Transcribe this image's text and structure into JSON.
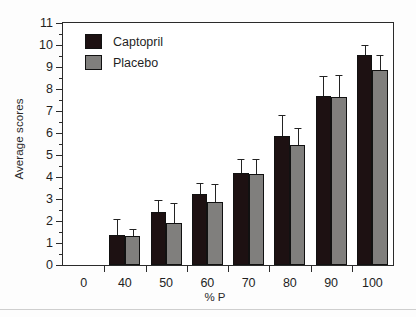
{
  "chart_data": {
    "type": "bar",
    "title": "",
    "xlabel": "% P",
    "ylabel": "Average scores",
    "categories": [
      "0",
      "40",
      "50",
      "60",
      "70",
      "80",
      "90",
      "100"
    ],
    "ylim": [
      0,
      11
    ],
    "ytick_labels": [
      "0",
      "1",
      "2",
      "3",
      "4",
      "5",
      "6",
      "7",
      "8",
      "9",
      "10",
      "11"
    ],
    "ytick_values": [
      0,
      1,
      2,
      3,
      4,
      5,
      6,
      7,
      8,
      9,
      10,
      11
    ],
    "grid": false,
    "legend_position": "top-left",
    "error_bar_style": "upper-only",
    "series": [
      {
        "name": "Captopril",
        "color": "#1d1112",
        "values": [
          null,
          1.35,
          2.4,
          3.25,
          4.2,
          5.85,
          7.7,
          9.55
        ],
        "errors": [
          null,
          0.75,
          0.55,
          0.5,
          0.6,
          0.95,
          0.9,
          0.45
        ]
      },
      {
        "name": "Placebo",
        "color": "#807f7d",
        "values": [
          null,
          1.3,
          1.9,
          2.85,
          4.15,
          5.45,
          7.65,
          8.85
        ],
        "errors": [
          null,
          0.35,
          0.9,
          0.85,
          0.65,
          0.8,
          1.0,
          0.7
        ]
      }
    ]
  },
  "legend": {
    "items": [
      {
        "label": "Captopril",
        "color": "#1d1112"
      },
      {
        "label": "Placebo",
        "color": "#807f7d"
      }
    ]
  },
  "axes": {
    "y_title": "Average scores",
    "x_title": "% P"
  }
}
